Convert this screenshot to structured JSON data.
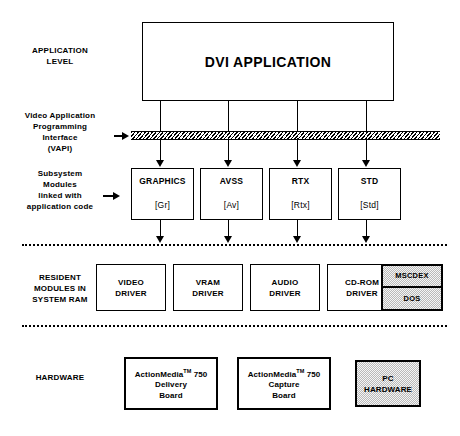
{
  "diagram": {
    "application": {
      "label": "DVI APPLICATION"
    },
    "side_labels": [
      {
        "id": "application-level",
        "lines": [
          "APPLICATION",
          "LEVEL"
        ]
      },
      {
        "id": "vapi",
        "lines": [
          "Video Application",
          "Programming",
          "Interface",
          "(VAPI)"
        ]
      },
      {
        "id": "subsystem-modules",
        "lines": [
          "Subsystem",
          "Modules",
          "linked with",
          "application code"
        ]
      },
      {
        "id": "resident-modules",
        "lines": [
          "RESIDENT",
          "MODULES IN",
          "SYSTEM RAM"
        ]
      },
      {
        "id": "hardware",
        "lines": [
          "HARDWARE"
        ]
      }
    ],
    "modules": [
      {
        "name": "GRAPHICS",
        "tag": "[Gr]"
      },
      {
        "name": "AVSS",
        "tag": "[Av]"
      },
      {
        "name": "RTX",
        "tag": "[Rtx]"
      },
      {
        "name": "STD",
        "tag": "[Std]"
      }
    ],
    "drivers": [
      {
        "line1": "VIDEO",
        "line2": "DRIVER"
      },
      {
        "line1": "VRAM",
        "line2": "DRIVER"
      },
      {
        "line1": "AUDIO",
        "line2": "DRIVER"
      },
      {
        "line1": "CD-ROM",
        "line2": "DRIVER"
      }
    ],
    "system_box": {
      "top": "MSCDEX",
      "bottom": "DOS"
    },
    "hardware": [
      {
        "line1": "ActionMedia",
        "tm": "TM",
        "line1b": " 750",
        "line2": "Delivery",
        "line3": "Board",
        "shaded": false
      },
      {
        "line1": "ActionMedia",
        "tm": "TM",
        "line1b": " 750",
        "line2": "Capture",
        "line3": "Board",
        "shaded": false
      },
      {
        "line1": "PC",
        "tm": "",
        "line1b": "",
        "line2": "HARDWARE",
        "line3": "",
        "shaded": true
      }
    ],
    "colors": {
      "stroke": "#000000",
      "background": "#ffffff",
      "shaded_fill": "#b9b9b9"
    }
  }
}
